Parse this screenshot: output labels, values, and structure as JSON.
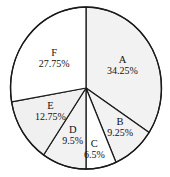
{
  "chart_data": {
    "type": "pie",
    "title": "",
    "xlabel": "",
    "ylabel": "",
    "legend": "none",
    "grid": false,
    "units": "percent",
    "total": 100,
    "start_angle_deg": 0,
    "direction": "clockwise",
    "categories": [
      "A",
      "B",
      "C",
      "D",
      "E",
      "F"
    ],
    "values": [
      34.25,
      9.25,
      6.5,
      9.5,
      12.75,
      27.75
    ],
    "labels": [
      "34.25%",
      "9.25%",
      "6.5%",
      "9.5%",
      "12.75%",
      "27.75%"
    ],
    "slices": [
      {
        "name": "A",
        "value": 34.25,
        "label": "34.25%",
        "color": "#f2f2f2"
      },
      {
        "name": "B",
        "value": 9.25,
        "label": "9.25%",
        "color": "#f2f2f2"
      },
      {
        "name": "C",
        "value": 6.5,
        "label": "6.5%",
        "color": "#ffffff"
      },
      {
        "name": "D",
        "value": 9.5,
        "label": "9.5%",
        "color": "#f2f2f2"
      },
      {
        "name": "E",
        "value": 12.75,
        "label": "12.75%",
        "color": "#f0f0f0"
      },
      {
        "name": "F",
        "value": 27.75,
        "label": "27.75%",
        "color": "#ffffff"
      }
    ]
  },
  "style": {
    "background": "#ffffff",
    "outline_color": "#1a1a1a",
    "text_color": "#111111"
  }
}
